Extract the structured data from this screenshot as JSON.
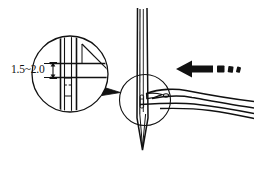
{
  "figure": {
    "background_color": "#ffffff",
    "line_color": "#111111",
    "width": 254,
    "height": 169
  },
  "annotations": {
    "dimension_label": "1.5~2.0",
    "dimension_units_implied": "mm"
  },
  "parts": {
    "needle_label": "needle",
    "needle_eye_label": "needle-eye",
    "needle_point_label": "needle-point",
    "looper_label": "looper-hook",
    "looper_tip_label": "looper-tip",
    "magnifier_label": "magnified-detail-circle",
    "callout_circle_label": "callout-circle",
    "leader_label": "callout-leader",
    "arrow_label": "motion-arrow",
    "motion_trail_label": "motion-trail"
  },
  "detail_view": {
    "caption": "1.5~2.0",
    "shows": "clearance between looper tip and needle eye"
  }
}
